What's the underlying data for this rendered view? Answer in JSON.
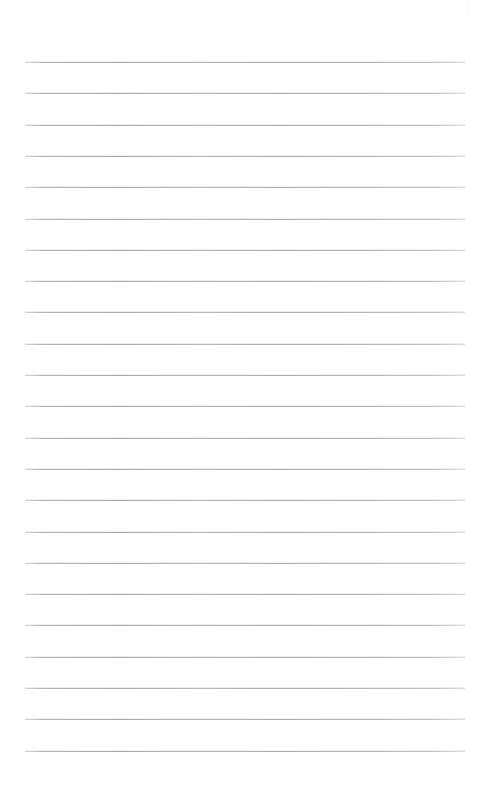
{
  "page": {
    "kind": "ruled-notebook-paper",
    "width": 477,
    "height": 790,
    "background_color": "#ffffff",
    "text_content": "",
    "is_blank": true
  },
  "rules": {
    "line_color": "#b0b0b0",
    "line_thickness_px": 1,
    "line_count": 23,
    "first_line_y": 62,
    "line_spacing_px": 31.3,
    "left_margin_x": 25,
    "right_margin_x": 465,
    "line_length_px": 440,
    "top_blank_px": 62,
    "bottom_blank_px": 40,
    "y_positions": [
      62,
      93.3,
      124.6,
      155.9,
      187.2,
      218.5,
      249.8,
      281.1,
      312.4,
      343.7,
      375,
      406.3,
      437.6,
      468.9,
      500.2,
      531.5,
      562.8,
      594.1,
      625.4,
      656.7,
      688,
      719.3,
      750.6
    ]
  },
  "artifact": {
    "name": "top-right-speck",
    "x": 466,
    "y": 4,
    "width": 3,
    "height": 12,
    "color": "#fbfbfb"
  }
}
